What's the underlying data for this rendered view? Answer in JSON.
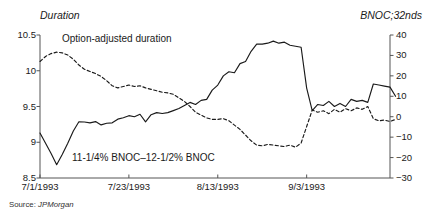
{
  "chart_data": {
    "type": "line",
    "title": "",
    "xlabel": "",
    "ylabel": "Duration",
    "y2label": "BNOC;32nds",
    "grid": false,
    "legend_position": "inline-annotations",
    "x_tick_labels": [
      "7/1/1993",
      "7/23/1993",
      "8/13/1993",
      "9/3/1993"
    ],
    "x_tick_positions": [
      0,
      16,
      32,
      48
    ],
    "x_range": [
      0,
      63
    ],
    "ylim": [
      8.5,
      10.5
    ],
    "y_ticks": [
      "8.5",
      "9",
      "9.5",
      "10",
      "10.5"
    ],
    "y2lim": [
      -30,
      40
    ],
    "y2_ticks": [
      "-30",
      "-20",
      "-10",
      "0",
      "10",
      "20",
      "30",
      "40"
    ],
    "series": [
      {
        "name": "11-1/4% BNOC–12-1/2% BNOC",
        "axis": "right",
        "style": "solid",
        "color": "#1a1a1a",
        "values": [
          -8.0,
          -13.0,
          -18.0,
          -23.5,
          -18.5,
          -13.0,
          -7.0,
          -2.5,
          -2.6,
          -3.0,
          -2.4,
          -4.0,
          -3.2,
          -3.0,
          -1.2,
          -0.5,
          0.5,
          0.0,
          1.2,
          -2.5,
          1.0,
          2.0,
          1.6,
          2.0,
          3.0,
          4.0,
          5.5,
          7.0,
          6.0,
          8.0,
          8.5,
          13.0,
          15.5,
          20.0,
          22.0,
          21.5,
          26.0,
          27.0,
          32.0,
          35.5,
          35.5,
          36.0,
          37.0,
          36.0,
          36.5,
          35.0,
          34.5,
          34.0,
          14.0,
          3.0,
          6.0,
          5.5,
          7.5,
          5.0,
          6.5,
          5.0,
          8.5,
          7.5,
          8.0,
          7.0,
          16.0,
          15.5,
          15.0,
          14.5,
          10.0
        ]
      },
      {
        "name": "Option-adjusted duration",
        "axis": "left",
        "style": "dashed",
        "color": "#1a1a1a",
        "values": [
          10.13,
          10.2,
          10.24,
          10.26,
          10.25,
          10.22,
          10.16,
          10.08,
          10.02,
          9.99,
          9.96,
          9.92,
          9.86,
          9.79,
          9.76,
          9.78,
          9.8,
          9.78,
          9.79,
          9.76,
          9.74,
          9.72,
          9.7,
          9.69,
          9.67,
          9.62,
          9.57,
          9.5,
          9.42,
          9.38,
          9.34,
          9.32,
          9.32,
          9.33,
          9.3,
          9.24,
          9.18,
          9.1,
          9.02,
          8.96,
          8.95,
          8.97,
          8.96,
          8.95,
          8.94,
          8.96,
          8.93,
          8.99,
          9.22,
          9.45,
          9.42,
          9.44,
          9.4,
          9.46,
          9.42,
          9.47,
          9.44,
          9.48,
          9.46,
          9.5,
          9.33,
          9.3,
          9.31,
          9.29,
          9.32
        ]
      }
    ],
    "annotations": [
      {
        "text": "Option-adjusted duration",
        "target": "dashed-series"
      },
      {
        "text": "11-1/4% BNOC–12-1/2% BNOC",
        "target": "solid-series"
      }
    ]
  },
  "left_axis": {
    "title": "Duration",
    "ticks": [
      "10.5",
      "10",
      "9.5",
      "9",
      "8.5"
    ]
  },
  "right_axis": {
    "title": "BNOC;32nds",
    "ticks": [
      "40",
      "30",
      "20",
      "10",
      "0",
      "−10",
      "−20",
      "−30"
    ]
  },
  "x_axis": {
    "ticks": [
      "7/1/1993",
      "7/23/1993",
      "8/13/1993",
      "9/3/1993"
    ]
  },
  "labels": {
    "option_adjusted_duration": "Option-adjusted duration",
    "bnoc_spread": "11-1/4% BNOC–12-1/2% BNOC"
  },
  "source": {
    "prefix": "Source: ",
    "name": "JPMorgan"
  },
  "colors": {
    "ink": "#1a1a1a",
    "axis": "#555555",
    "background": "#ffffff"
  }
}
